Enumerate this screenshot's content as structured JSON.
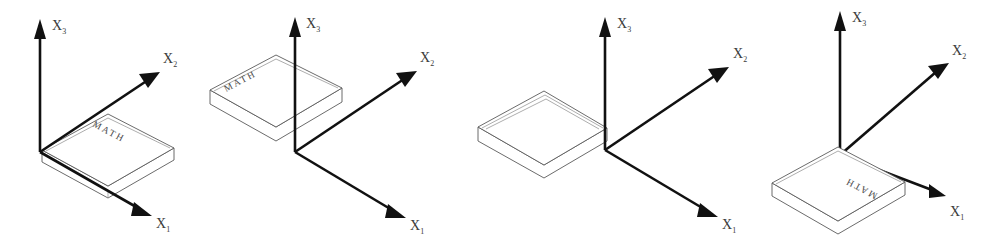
{
  "figure": {
    "background_color": "#ffffff",
    "line_color": "#111111",
    "book_outline_color": "#5a5a5a",
    "label_color": "#3b3b3b",
    "axis_label_base": "X",
    "book_cover_text": "MATH",
    "panel_count": 4
  },
  "panels": [
    {
      "id": "panel-1",
      "name": "initial-orientation",
      "origin": {
        "x": 40,
        "y": 152
      },
      "axes": [
        {
          "name": "x3-axis",
          "label_base": "X",
          "subscript": "3",
          "label_x": 52,
          "label_y": 30,
          "direction": "up"
        },
        {
          "name": "x2-axis",
          "label_base": "X",
          "subscript": "2",
          "label_x": 163,
          "label_y": 63,
          "direction": "upper-right"
        },
        {
          "name": "x1-axis",
          "label_base": "X",
          "subscript": "1",
          "label_x": 156,
          "label_y": 223,
          "direction": "lower-right"
        }
      ],
      "book": {
        "name": "book-math",
        "cover_text": "MATH",
        "text_visible": true,
        "text_rotation_deg": 28,
        "state": "cover-up-facing-viewer"
      }
    },
    {
      "id": "panel-2",
      "name": "after-first-rotation",
      "origin": {
        "x": 295,
        "y": 152
      },
      "axes": [
        {
          "name": "x3-axis",
          "label_base": "X",
          "subscript": "3",
          "label_x": 306,
          "label_y": 28,
          "direction": "up"
        },
        {
          "name": "x2-axis",
          "label_base": "X",
          "subscript": "2",
          "label_x": 420,
          "label_y": 62,
          "direction": "upper-right"
        },
        {
          "name": "x1-axis",
          "label_base": "X",
          "subscript": "1",
          "label_x": 410,
          "label_y": 225,
          "direction": "lower-right"
        }
      ],
      "book": {
        "name": "book-math",
        "cover_text": "MATH",
        "text_visible": true,
        "text_rotation_deg": -28,
        "state": "rotated-to-left-of-vertical-axis"
      }
    },
    {
      "id": "panel-3",
      "name": "after-second-rotation",
      "origin": {
        "x": 605,
        "y": 150
      },
      "axes": [
        {
          "name": "x3-axis",
          "label_base": "X",
          "subscript": "3",
          "label_x": 617,
          "label_y": 28,
          "direction": "up"
        },
        {
          "name": "x2-axis",
          "label_base": "X",
          "subscript": "2",
          "label_x": 733,
          "label_y": 58,
          "direction": "upper-right"
        },
        {
          "name": "x1-axis",
          "label_base": "X",
          "subscript": "1",
          "label_x": 722,
          "label_y": 224,
          "direction": "lower-right"
        }
      ],
      "book": {
        "name": "book-blank",
        "cover_text": "",
        "text_visible": false,
        "text_rotation_deg": 0,
        "state": "flipped-cover-hidden"
      }
    },
    {
      "id": "panel-4",
      "name": "after-third-rotation",
      "origin": {
        "x": 840,
        "y": 155
      },
      "axes": [
        {
          "name": "x3-axis",
          "label_base": "X",
          "subscript": "3",
          "label_x": 852,
          "label_y": 22,
          "direction": "up"
        },
        {
          "name": "x2-axis",
          "label_base": "X",
          "subscript": "2",
          "label_x": 952,
          "label_y": 55,
          "direction": "upper-right"
        },
        {
          "name": "x1-axis",
          "label_base": "X",
          "subscript": "1",
          "label_x": 950,
          "label_y": 216,
          "direction": "lower-right-short"
        }
      ],
      "book": {
        "name": "book-math-inverted",
        "cover_text": "MATH",
        "text_visible": true,
        "text_rotation_deg": 208,
        "state": "rotated-below-origin-text-inverted"
      }
    }
  ]
}
